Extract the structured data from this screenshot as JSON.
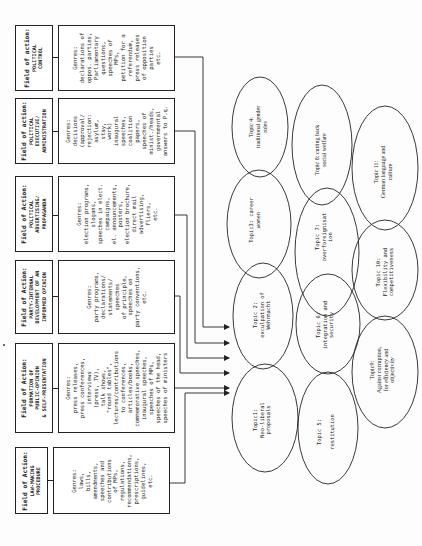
{
  "fields": [
    {
      "id": "political-control",
      "label": "Field of action:",
      "name_lines": [
        "POLITICAL",
        "CONTROL"
      ],
      "genres_label": "Genres:",
      "genres_lines": [
        "declarations of",
        "oppos. parties,",
        "Parliamentary",
        "questions,",
        "speeches of",
        "MPs,",
        "petition for a",
        "referendum,",
        "press releases",
        "of opposition",
        "parties",
        "etc."
      ]
    },
    {
      "id": "political-executive",
      "label": "Field of action:",
      "name_lines": [
        "POLITICAL",
        "EXECUTIVE/",
        "ADMINISTRATION"
      ],
      "genres_label": "Genres:",
      "genres_lines": [
        "decisions",
        "(approval/",
        "rejection:",
        "asylum,",
        "stay,",
        "work)",
        "inaugural",
        "speeches,",
        "coalition",
        "papers,",
        "speeches of",
        "minist./heads,",
        "governmental",
        "answers to P.q."
      ]
    },
    {
      "id": "political-advertising",
      "label": "Field of Action:",
      "name_lines": [
        "POLITICAL",
        "ADVERTISING/",
        "PROPAGANDA"
      ],
      "genres_label": "Genres:",
      "genres_lines": [
        "election programs,",
        "slogans,",
        "speeches in elect.",
        "campaigns,",
        "el. announcements,",
        "posters,",
        "election brochure,",
        "direct mail",
        "advertising,",
        "fliers,",
        "etc."
      ]
    },
    {
      "id": "party-internal",
      "label": "Field of Action:",
      "name_lines": [
        "PARTY-INTERNAL",
        "DEVELOPMENT OF AN",
        "INFORMED OPINION"
      ],
      "genres_label": "Genres:",
      "genres_lines": [
        "party programs,",
        "declarations/",
        "statements/",
        "speeches",
        "of principle,",
        "speeches on",
        "party conventions,",
        "etc."
      ]
    },
    {
      "id": "public-opinion",
      "label": "Field of Action:",
      "name_lines": [
        "FORMATION OF",
        "PUBLIC-OPINION",
        "& SELF-PRESENTATION"
      ],
      "genres_label": "Genres:",
      "genres_lines": [
        "press releases,",
        "press conferences,",
        "interviews",
        "(press, TV),",
        "talk shows,",
        "\"round tables\",",
        "lectures/contributions",
        "to conferences,",
        "articles/books,",
        "commemorative speeches,",
        "inaugural speeches,",
        "speeches of MPs,",
        "speeches of the head,",
        "speeches of ministers"
      ]
    },
    {
      "id": "law-making",
      "label": "Field of Action:",
      "name_lines": [
        "LAW-MAKING",
        "PROCEDURE"
      ],
      "genres_label": "Genres:",
      "genres_lines": [
        "laws,",
        "bills,",
        "amendments,",
        "speeches and",
        "contributions",
        "of MPs,",
        "regulations,",
        "recommendations,",
        "prescriptions,",
        "guidelines,",
        "etc."
      ]
    }
  ],
  "topics": [
    {
      "id": "topic-1",
      "lines": [
        "Topic1:",
        "Neo-liberal",
        "proposals"
      ],
      "style": "mono"
    },
    {
      "id": "topic-2",
      "lines": [
        "Topic 2:",
        "exculpation of",
        "Wehrmacht"
      ],
      "style": "mono"
    },
    {
      "id": "topic-3",
      "lines": [
        "Topic3: career",
        "women"
      ],
      "style": "mono"
    },
    {
      "id": "topic-4",
      "lines": [
        "Topic 4:",
        "traditional gender",
        "roles"
      ],
      "style": "serif"
    },
    {
      "id": "topic-5",
      "lines": [
        "Topic 5:",
        "",
        "restitution"
      ],
      "style": "mono"
    },
    {
      "id": "topic-6",
      "lines": [
        "Topic 6:",
        "integration and",
        "security"
      ],
      "style": "mono"
    },
    {
      "id": "topic-7",
      "lines": [
        "Topic 7:",
        "overforeignisat",
        "ion"
      ],
      "style": "mono"
    },
    {
      "id": "topic-8",
      "lines": [
        "Topic 8: cutting back",
        "social welfare"
      ],
      "style": "serif"
    },
    {
      "id": "topic-9",
      "lines": [
        "Topic9:",
        "Against corruption,",
        "for efficiency and",
        "objectivity"
      ],
      "style": "serif"
    },
    {
      "id": "topic-10",
      "lines": [
        "Topic 10:",
        "Flexibility and",
        "competitiveness"
      ],
      "style": "mono"
    },
    {
      "id": "topic-11",
      "lines": [
        "Topic 11:",
        "German language and",
        "culture"
      ],
      "style": "serif"
    }
  ],
  "colors": {
    "line": "#222222",
    "paper": "#fdfdfd"
  }
}
